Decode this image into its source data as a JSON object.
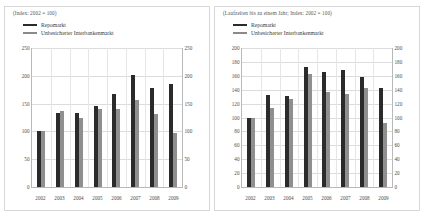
{
  "figure": {
    "legend_labels": [
      "Repomarkt",
      "Unbesicherter Interbankenmarkt"
    ],
    "colors": {
      "repo": "#2b2b2b",
      "unsecured": "#8f8f8f",
      "grid": "#dcdcdc",
      "axis": "#b9b9b9"
    }
  },
  "chart_data": [
    {
      "type": "bar",
      "title": "(Index: 2002 = 100)",
      "xlabel": "",
      "ylabel": "",
      "categories": [
        "2002",
        "2003",
        "2004",
        "2005",
        "2006",
        "2007",
        "2008",
        "2009"
      ],
      "series": [
        {
          "name": "Repomarkt",
          "values": [
            100,
            134,
            133,
            146,
            168,
            202,
            178,
            185
          ]
        },
        {
          "name": "Unbesicherter Interbankenmarkt",
          "values": [
            100,
            136,
            125,
            141,
            140,
            156,
            132,
            98
          ]
        }
      ],
      "ylim": [
        0,
        250
      ],
      "yticks": [
        0,
        50,
        100,
        150,
        200,
        250
      ],
      "yticks_right": [
        0,
        50,
        100,
        150,
        200,
        250
      ],
      "grid": true,
      "legend_position": "top-left"
    },
    {
      "type": "bar",
      "title": "(Laufzeiten bis zu einem Jahr; Index: 2002 = 100)",
      "xlabel": "",
      "ylabel": "",
      "categories": [
        "2002",
        "2003",
        "2004",
        "2005",
        "2006",
        "2007",
        "2008",
        "2009"
      ],
      "series": [
        {
          "name": "Repomarkt",
          "values": [
            100,
            132,
            131,
            172,
            165,
            168,
            158,
            143
          ]
        },
        {
          "name": "Unbesicherter Interbankenmarkt",
          "values": [
            100,
            114,
            126,
            163,
            136,
            134,
            143,
            92
          ]
        }
      ],
      "ylim": [
        0,
        200
      ],
      "yticks": [
        0,
        20,
        40,
        60,
        80,
        100,
        120,
        140,
        160,
        180,
        200
      ],
      "yticks_right": [
        0,
        20,
        40,
        60,
        80,
        100,
        120,
        140,
        160,
        180,
        200
      ],
      "grid": true,
      "legend_position": "top-left"
    }
  ]
}
